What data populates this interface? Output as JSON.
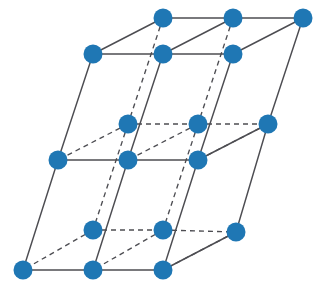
{
  "figure": {
    "title": "",
    "caption": "",
    "kind": "crystal-lattice-diagram",
    "background_color": "#ffffff"
  },
  "chart_data": {
    "type": "scatter",
    "title": "",
    "subtitle": "",
    "xlabel": "",
    "ylabel": "",
    "grid": false,
    "legend": null,
    "axis_visible": false,
    "tick_labels": [],
    "annotations": [],
    "xlim": [
      0,
      327
    ],
    "ylim": [
      0,
      300
    ],
    "style": {
      "node_color": "#1f77b4",
      "node_radius": 9.5,
      "edge_color": "#4d4d52",
      "edge_width_solid": 1.45,
      "edge_width_dashed": 1.35,
      "dash_pattern": "5 4"
    },
    "lattice": {
      "counts": {
        "i": 3,
        "j": 2,
        "k": 3
      },
      "vector_a": {
        "dx": 70,
        "dy": 0
      },
      "vector_b": {
        "dx": -35,
        "dy": 35
      },
      "vector_c": {
        "dx": 0,
        "dy": 106
      },
      "origin": {
        "x": 163,
        "y": 18
      }
    },
    "nodes": [
      {
        "id": "n0",
        "label": "atom",
        "i": 0,
        "j": 0,
        "k": 0,
        "x": 163,
        "y": 18,
        "hidden": false
      },
      {
        "id": "n1",
        "label": "atom",
        "i": 1,
        "j": 0,
        "k": 0,
        "x": 233,
        "y": 18,
        "hidden": false
      },
      {
        "id": "n2",
        "label": "atom",
        "i": 2,
        "j": 0,
        "k": 0,
        "x": 303,
        "y": 18,
        "hidden": false
      },
      {
        "id": "n3",
        "label": "atom",
        "i": 0,
        "j": 1,
        "k": 0,
        "x": 93,
        "y": 54,
        "hidden": false
      },
      {
        "id": "n4",
        "label": "atom",
        "i": 1,
        "j": 1,
        "k": 0,
        "x": 163,
        "y": 54,
        "hidden": false
      },
      {
        "id": "n5",
        "label": "atom",
        "i": 2,
        "j": 1,
        "k": 0,
        "x": 233,
        "y": 54,
        "hidden": false
      },
      {
        "id": "n6",
        "label": "atom",
        "i": 0,
        "j": 0,
        "k": 1,
        "x": 128,
        "y": 124,
        "hidden": true
      },
      {
        "id": "n7",
        "label": "atom",
        "i": 1,
        "j": 0,
        "k": 1,
        "x": 198,
        "y": 124,
        "hidden": true
      },
      {
        "id": "n8",
        "label": "atom",
        "i": 2,
        "j": 0,
        "k": 1,
        "x": 268,
        "y": 124,
        "hidden": false
      },
      {
        "id": "n9",
        "label": "atom",
        "i": 0,
        "j": 1,
        "k": 1,
        "x": 58,
        "y": 160,
        "hidden": false
      },
      {
        "id": "n10",
        "label": "atom",
        "i": 1,
        "j": 1,
        "k": 1,
        "x": 128,
        "y": 160,
        "hidden": false
      },
      {
        "id": "n11",
        "label": "atom",
        "i": 2,
        "j": 1,
        "k": 1,
        "x": 198,
        "y": 160,
        "hidden": false
      },
      {
        "id": "n12",
        "label": "atom",
        "i": 0,
        "j": 0,
        "k": 2,
        "x": 93,
        "y": 230,
        "hidden": true
      },
      {
        "id": "n13",
        "label": "atom",
        "i": 1,
        "j": 0,
        "k": 2,
        "x": 163,
        "y": 230,
        "hidden": true
      },
      {
        "id": "n14",
        "label": "atom",
        "i": 2,
        "j": 0,
        "k": 2,
        "x": 236,
        "y": 232,
        "hidden": false
      },
      {
        "id": "n15",
        "label": "atom",
        "i": 0,
        "j": 1,
        "k": 2,
        "x": 23,
        "y": 270,
        "hidden": false
      },
      {
        "id": "n16",
        "label": "atom",
        "i": 1,
        "j": 1,
        "k": 2,
        "x": 93,
        "y": 270,
        "hidden": false
      },
      {
        "id": "n17",
        "label": "atom",
        "i": 2,
        "j": 1,
        "k": 2,
        "x": 163,
        "y": 270,
        "hidden": false
      }
    ],
    "edges_solid": [
      {
        "from": "n0",
        "to": "n1"
      },
      {
        "from": "n1",
        "to": "n2"
      },
      {
        "from": "n3",
        "to": "n4"
      },
      {
        "from": "n4",
        "to": "n5"
      },
      {
        "from": "n0",
        "to": "n3"
      },
      {
        "from": "n1",
        "to": "n4"
      },
      {
        "from": "n2",
        "to": "n5"
      },
      {
        "from": "n9",
        "to": "n10"
      },
      {
        "from": "n10",
        "to": "n11"
      },
      {
        "from": "n8",
        "to": "n11"
      },
      {
        "from": "n15",
        "to": "n16"
      },
      {
        "from": "n16",
        "to": "n17"
      },
      {
        "from": "n14",
        "to": "n17"
      },
      {
        "from": "n3",
        "to": "n9"
      },
      {
        "from": "n4",
        "to": "n10"
      },
      {
        "from": "n5",
        "to": "n11"
      },
      {
        "from": "n9",
        "to": "n15"
      },
      {
        "from": "n10",
        "to": "n16"
      },
      {
        "from": "n11",
        "to": "n17"
      },
      {
        "from": "n2",
        "to": "n8"
      },
      {
        "from": "n8",
        "to": "n14"
      }
    ],
    "edges_dashed": [
      {
        "from": "n6",
        "to": "n7"
      },
      {
        "from": "n7",
        "to": "n8"
      },
      {
        "from": "n12",
        "to": "n13"
      },
      {
        "from": "n13",
        "to": "n14"
      },
      {
        "from": "n6",
        "to": "n9"
      },
      {
        "from": "n7",
        "to": "n10"
      },
      {
        "from": "n8",
        "to": "n11"
      },
      {
        "from": "n12",
        "to": "n15"
      },
      {
        "from": "n13",
        "to": "n16"
      },
      {
        "from": "n14",
        "to": "n17"
      },
      {
        "from": "n0",
        "to": "n6"
      },
      {
        "from": "n1",
        "to": "n7"
      },
      {
        "from": "n6",
        "to": "n12"
      },
      {
        "from": "n7",
        "to": "n13"
      }
    ]
  }
}
